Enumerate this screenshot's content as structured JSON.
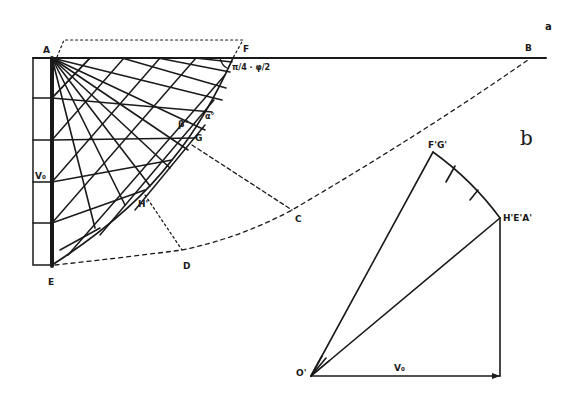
{
  "figure": {
    "panel_a": {
      "panel_label": "a",
      "points": {
        "A": "A",
        "B": "B",
        "C": "C",
        "D": "D",
        "E": "E",
        "F": "F",
        "G": "G",
        "H": "H'"
      },
      "annotations": {
        "wall_height": "V₀",
        "angle_at_F": "π/4 · φ/2",
        "angle_beta": "β°",
        "angle_alpha": "α°"
      }
    },
    "panel_b": {
      "panel_label": "b",
      "points": {
        "origin": "O'",
        "top": "F'G'",
        "right": "H'E'A'"
      },
      "annotations": {
        "base_vector": "V₀"
      }
    },
    "colors": {
      "ink": "#1a1a1a",
      "background": "#ffffff"
    }
  }
}
